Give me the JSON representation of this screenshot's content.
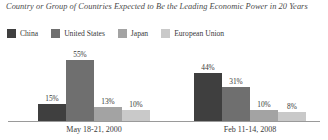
{
  "chart_data": {
    "type": "bar",
    "title": "Country or Group of Countries Expected to Be the Leading Economic Power in 20 Years",
    "xlabel": "",
    "ylabel": "",
    "ylim": [
      0,
      60
    ],
    "grid": false,
    "legend_position": "top-left",
    "categories": [
      "May 18-21, 2000",
      "Feb 11-14, 2008"
    ],
    "series": [
      {
        "name": "China",
        "color": "#3f3f3f",
        "values": [
          15,
          44
        ],
        "labels": [
          "15%",
          "44%"
        ]
      },
      {
        "name": "United States",
        "color": "#6f6f6f",
        "values": [
          55,
          31
        ],
        "labels": [
          "55%",
          "31%"
        ]
      },
      {
        "name": "Japan",
        "color": "#a3a3a3",
        "values": [
          13,
          10
        ],
        "labels": [
          "13%",
          "10%"
        ]
      },
      {
        "name": "European Union",
        "color": "#c9c9c9",
        "values": [
          10,
          8
        ],
        "labels": [
          "10%",
          "8%"
        ]
      }
    ]
  }
}
